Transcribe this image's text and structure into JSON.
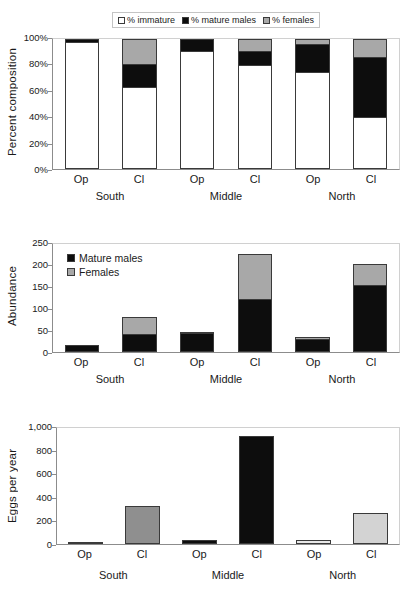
{
  "figure": {
    "colors": {
      "immature": "#ffffff",
      "mature_males": "#0d0d0d",
      "females": "#a8a8a8",
      "axis": "#8c8c8c",
      "bar_outline": "#3a3a3a",
      "eggs_south_cl": "#8f8f8f",
      "eggs_middle_cl": "#0d0d0d",
      "eggs_north_cl": "#d3d3d3"
    },
    "categories": [
      "Op",
      "Cl",
      "Op",
      "Cl",
      "Op",
      "Cl"
    ],
    "groups": [
      "South",
      "Middle",
      "North"
    ]
  },
  "chart_data": [
    {
      "type": "bar",
      "stacked": true,
      "percent": true,
      "title": "",
      "xlabel": "",
      "ylabel": "Percent composition",
      "ylim": [
        0,
        100
      ],
      "yticks": [
        "0%",
        "20%",
        "40%",
        "60%",
        "80%",
        "100%"
      ],
      "ytick_values": [
        0,
        20,
        40,
        60,
        80,
        100
      ],
      "grid": false,
      "legend_position": "top-center",
      "categories": [
        "Op",
        "Cl",
        "Op",
        "Cl",
        "Op",
        "Cl"
      ],
      "group_labels": [
        "South",
        "Middle",
        "North"
      ],
      "series": [
        {
          "name": "% immature",
          "values": [
            98,
            63,
            91,
            80,
            75,
            40
          ]
        },
        {
          "name": "% mature males",
          "values": [
            2,
            18,
            9,
            11,
            21,
            46
          ]
        },
        {
          "name": "% females",
          "values": [
            0,
            19,
            0,
            9,
            4,
            14
          ]
        }
      ]
    },
    {
      "type": "bar",
      "stacked": true,
      "percent": false,
      "title": "",
      "xlabel": "",
      "ylabel": "Abundance",
      "ylim": [
        0,
        250
      ],
      "yticks": [
        "0",
        "50",
        "100",
        "150",
        "200",
        "250"
      ],
      "ytick_values": [
        0,
        50,
        100,
        150,
        200,
        250
      ],
      "grid": false,
      "legend_position": "inside-top-left",
      "categories": [
        "Op",
        "Cl",
        "Op",
        "Cl",
        "Op",
        "Cl"
      ],
      "group_labels": [
        "South",
        "Middle",
        "North"
      ],
      "series": [
        {
          "name": "Mature males",
          "values": [
            17,
            41,
            44,
            123,
            31,
            154
          ]
        },
        {
          "name": "Females",
          "values": [
            0,
            39,
            2,
            104,
            4,
            49
          ]
        }
      ]
    },
    {
      "type": "bar",
      "stacked": false,
      "percent": false,
      "title": "",
      "xlabel": "",
      "ylabel": "Eggs per year",
      "ylim": [
        0,
        1000
      ],
      "yticks": [
        "0",
        "200",
        "400",
        "600",
        "800",
        "1,000"
      ],
      "ytick_values": [
        0,
        200,
        400,
        600,
        800,
        1000
      ],
      "grid": false,
      "legend_position": "none",
      "categories": [
        "Op",
        "Cl",
        "Op",
        "Cl",
        "Op",
        "Cl"
      ],
      "group_labels": [
        "South",
        "Middle",
        "North"
      ],
      "values": [
        18,
        330,
        32,
        930,
        38,
        270
      ],
      "bar_colors": [
        "#8f8f8f",
        "#8f8f8f",
        "#0d0d0d",
        "#0d0d0d",
        "#e8e8e8",
        "#d3d3d3"
      ]
    }
  ]
}
